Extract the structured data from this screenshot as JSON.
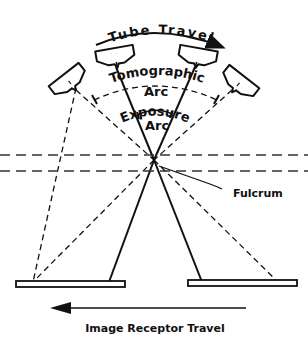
{
  "diagram": {
    "labels": {
      "tube_travel": "Tube Travel",
      "tomographic": "Tomographic",
      "tomographic_arc": "Arc",
      "exposure": "Exposure",
      "exposure_arc": "Arc",
      "fulcrum": "Fulcrum",
      "image_receptor_travel": "Image Receptor Travel"
    },
    "elements": {
      "tubes": [
        "tube-far-left",
        "tube-left",
        "tube-right",
        "tube-far-right"
      ],
      "receptors": [
        "receptor-left",
        "receptor-right"
      ],
      "fulcrum_planes": 2
    },
    "colors": {
      "line": "#111111",
      "background": "#ffffff"
    }
  }
}
